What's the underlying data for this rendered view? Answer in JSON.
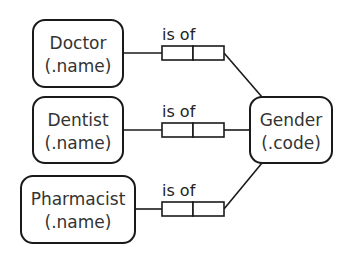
{
  "diagram": {
    "entities": [
      {
        "id": "doctor",
        "name": "Doctor",
        "ref": "(.name)"
      },
      {
        "id": "dentist",
        "name": "Dentist",
        "ref": "(.name)"
      },
      {
        "id": "pharmacist",
        "name": "Pharmacist",
        "ref": "(.name)"
      },
      {
        "id": "gender",
        "name": "Gender",
        "ref": "(.code)"
      }
    ],
    "fact_types": [
      {
        "from": "doctor",
        "to": "gender",
        "reading": "is of"
      },
      {
        "from": "dentist",
        "to": "gender",
        "reading": "is of"
      },
      {
        "from": "pharmacist",
        "to": "gender",
        "reading": "is of"
      }
    ]
  }
}
